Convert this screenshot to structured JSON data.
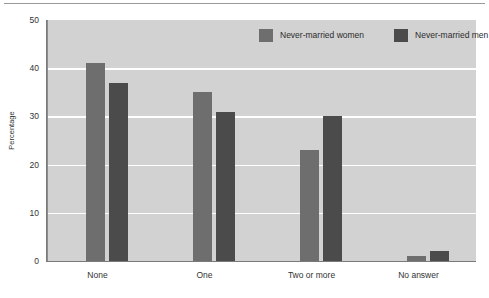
{
  "chart_data": {
    "type": "bar",
    "title": "",
    "subtitle": "",
    "xlabel": "",
    "ylabel": "Percentage",
    "ylim": [
      0,
      50
    ],
    "yticks": [
      "0",
      "10",
      "20",
      "30",
      "40",
      "50"
    ],
    "grid": true,
    "legend_position": "top-right",
    "categories": [
      "None",
      "One",
      "Two or more",
      "No answer"
    ],
    "series": [
      {
        "name": "Never-married women",
        "color": "#6e6e6e",
        "values": [
          41,
          35,
          23,
          1
        ]
      },
      {
        "name": "Never-married men",
        "color": "#4b4b4b",
        "values": [
          37,
          31,
          30,
          2
        ]
      }
    ]
  },
  "legend": {
    "entries": [
      {
        "label": "Never-married women",
        "swatch": "#6e6e6e"
      },
      {
        "label": "Never-married men",
        "swatch": "#4b4b4b"
      }
    ]
  },
  "axes": {
    "y_label": "Percentage",
    "y_ticks": [
      "50",
      "40",
      "30",
      "20",
      "10",
      "0"
    ],
    "x_ticks": [
      "None",
      "One",
      "Two or more",
      "No answer"
    ]
  },
  "colors": {
    "plot_background": "#d2d2d2",
    "gridline": "#ffffff",
    "axis": "#7a7a7a",
    "series_women": "#6e6e6e",
    "series_men": "#4b4b4b",
    "text": "#333333"
  }
}
